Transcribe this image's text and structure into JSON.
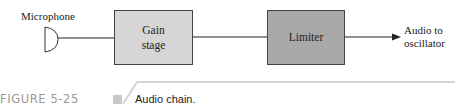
{
  "diagram": {
    "title": "Audio chain",
    "nodes": [
      {
        "id": "microphone",
        "label": "Microphone",
        "shape": "microphone-symbol"
      },
      {
        "id": "gain",
        "label_line1": "Gain",
        "label_line2": "stage",
        "fill": "#d6d6d6"
      },
      {
        "id": "limiter",
        "label": "Limiter",
        "fill": "#a9a9a9"
      },
      {
        "id": "output",
        "label_line1": "Audio to",
        "label_line2": "oscillator"
      }
    ],
    "edges": [
      {
        "from": "microphone",
        "to": "gain",
        "arrow": false
      },
      {
        "from": "gain",
        "to": "limiter",
        "arrow": false
      },
      {
        "from": "limiter",
        "to": "output",
        "arrow": true
      }
    ]
  },
  "caption": {
    "figure_number": "FIGURE 5-25",
    "text": "Audio chain."
  },
  "colors": {
    "gain_fill": "#d6d6d6",
    "limiter_fill": "#a9a9a9",
    "caption_number": "#9a9a9a",
    "rule": "#d0d0d0"
  }
}
